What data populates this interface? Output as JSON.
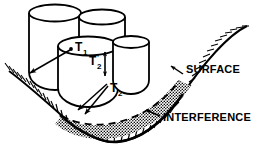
{
  "figure": {
    "background_color": "#ffffff",
    "line_color": "#000000",
    "width": 261,
    "height": 152
  },
  "labels": {
    "t1": {
      "base": "T",
      "sub": "1",
      "prime": ""
    },
    "t2prime": {
      "base": "T",
      "sub": "2",
      "prime": "'"
    },
    "t2": {
      "base": "T",
      "sub": "2",
      "prime": ""
    },
    "surface": "SURFACE",
    "interference": "INTERFERENCE"
  },
  "elements": {
    "cylinders": [
      {
        "name": "cylinder-back-left"
      },
      {
        "name": "cylinder-front-center"
      },
      {
        "name": "cylinder-right"
      }
    ],
    "surface_curve": {
      "name": "surface-curve",
      "hatching": "true"
    },
    "interference_region": {
      "name": "interference-region",
      "fill": "stipple"
    },
    "dashed_boundary": {
      "name": "dashed-interference-boundary"
    },
    "leaders": [
      {
        "name": "leader-t1"
      },
      {
        "name": "leader-t2-a"
      },
      {
        "name": "leader-t2-b"
      },
      {
        "name": "leader-surface"
      },
      {
        "name": "leader-interference"
      },
      {
        "name": "arrow-t2prime"
      }
    ]
  }
}
